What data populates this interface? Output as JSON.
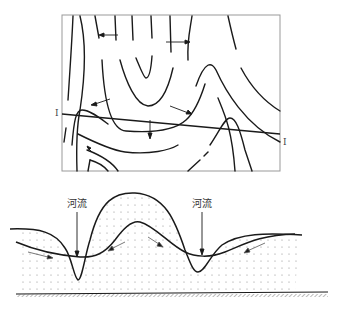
{
  "map": {
    "section_label_left": "I",
    "section_label_right": "I"
  },
  "cross_section": {
    "river_left_label": "河流",
    "river_right_label": "河流"
  },
  "colors": {
    "line": "#1a1a1a",
    "frame": "#999999",
    "dots": "#8a8a8a"
  }
}
